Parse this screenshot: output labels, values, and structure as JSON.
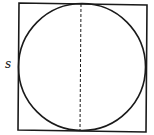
{
  "diagram": {
    "side_label": "s",
    "colors": {
      "stroke": "#1a1a1a",
      "background": "#ffffff"
    },
    "shapes": {
      "square": {
        "points": "19,3 147,5 146,132 18,130"
      },
      "circle": {
        "cx": 82,
        "cy": 67,
        "r": 63.5
      },
      "diameter": {
        "x1": 81,
        "y1": 4,
        "x2": 80,
        "y2": 130,
        "style": "dashed"
      }
    }
  }
}
